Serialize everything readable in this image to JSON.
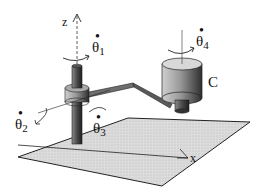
{
  "figure": {
    "axes": {
      "z_label": "z",
      "x_label": "x"
    },
    "joints": [
      {
        "id": "theta1",
        "symbol": "θ",
        "subscript": "1",
        "dot": "•"
      },
      {
        "id": "theta2",
        "symbol": "θ",
        "subscript": "2",
        "dot": "•"
      },
      {
        "id": "theta3",
        "symbol": "θ",
        "subscript": "3",
        "dot": "•"
      },
      {
        "id": "theta4",
        "symbol": "θ",
        "subscript": "4",
        "dot": "•"
      }
    ],
    "tool_label": "C",
    "colors": {
      "ink": "#111111",
      "plane": "#d4d4d4",
      "cylinder_light": "#bdbdbd",
      "cylinder_dark": "#3a3a3a"
    }
  }
}
